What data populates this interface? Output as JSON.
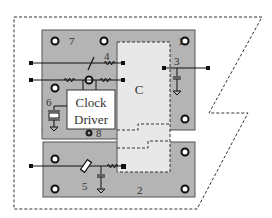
{
  "colors": {
    "board": "#b4b4b4",
    "board_stroke": "#555555",
    "region_c": "#e8e8e8",
    "clock_box": "#ffffff",
    "line": "#111111",
    "dash": "#333333"
  },
  "labels": {
    "region_c": "C",
    "clock_line1": "Clock",
    "clock_line2": "Driver",
    "n1": "1",
    "n2": "2",
    "n3": "3",
    "n4": "4",
    "n5": "5",
    "n6": "6",
    "n7": "7",
    "n8": "8"
  }
}
